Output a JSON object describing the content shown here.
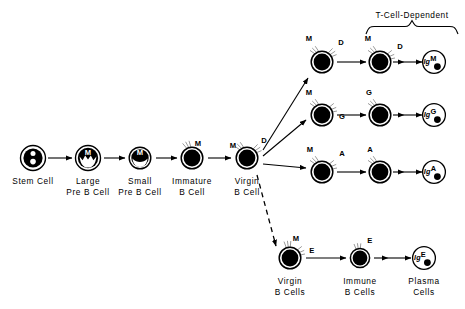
{
  "diagram": {
    "title_brace_label": "T-Cell-Dependent",
    "stages": [
      {
        "id": "stem",
        "label_line1": "Stem Cell",
        "label_line2": "",
        "x": 33,
        "y": 158
      },
      {
        "id": "large",
        "label_line1": "Large",
        "label_line2": "Pre B Cell",
        "x": 88,
        "y": 158
      },
      {
        "id": "small",
        "label_line1": "Small",
        "label_line2": "Pre B Cell",
        "x": 140,
        "y": 158
      },
      {
        "id": "immature",
        "label_line1": "Immature",
        "label_line2": "B Cell",
        "x": 192,
        "y": 158
      },
      {
        "id": "virgin",
        "label_line1": "Virgin",
        "label_line2": "B Cell",
        "x": 247,
        "y": 158
      }
    ],
    "branches": [
      {
        "id": "igm",
        "isotype": "M",
        "virgin_receptors": [
          "M",
          "D"
        ],
        "immune_receptors": [
          "M",
          "D"
        ],
        "plasma_label": "Ig",
        "plasma_superscript": "M",
        "arrow_style": "solid",
        "virgin_x": 322,
        "immune_x": 380,
        "plasma_x": 434,
        "y": 62
      },
      {
        "id": "igg",
        "isotype": "G",
        "virgin_receptors": [
          "M",
          "G"
        ],
        "immune_receptors": [
          "G"
        ],
        "plasma_label": "Ig",
        "plasma_superscript": "G",
        "arrow_style": "solid",
        "virgin_x": 322,
        "immune_x": 380,
        "plasma_x": 434,
        "y": 115
      },
      {
        "id": "iga",
        "isotype": "A",
        "virgin_receptors": [
          "M",
          "A"
        ],
        "immune_receptors": [
          "A"
        ],
        "plasma_label": "Ig",
        "plasma_superscript": "A",
        "arrow_style": "solid",
        "virgin_x": 322,
        "immune_x": 380,
        "plasma_x": 434,
        "y": 172
      },
      {
        "id": "ige",
        "isotype": "E",
        "virgin_receptors": [
          "M",
          "E"
        ],
        "immune_receptors": [
          "E"
        ],
        "plasma_label": "Ig",
        "plasma_superscript": "E",
        "arrow_style": "dashed",
        "virgin_x": 290,
        "immune_x": 360,
        "plasma_x": 424,
        "y": 258
      }
    ],
    "bottom_labels": [
      {
        "id": "virgin-b-cells",
        "line1": "Virgin",
        "line2": "B Cells",
        "x": 290
      },
      {
        "id": "immune-b-cells",
        "line1": "Immune",
        "line2": "B Cells",
        "x": 360
      },
      {
        "id": "plasma-cells",
        "line1": "Plasma",
        "line2": "Cells",
        "x": 424
      }
    ],
    "colors": {
      "ink": "#000000",
      "background": "#ffffff"
    }
  }
}
